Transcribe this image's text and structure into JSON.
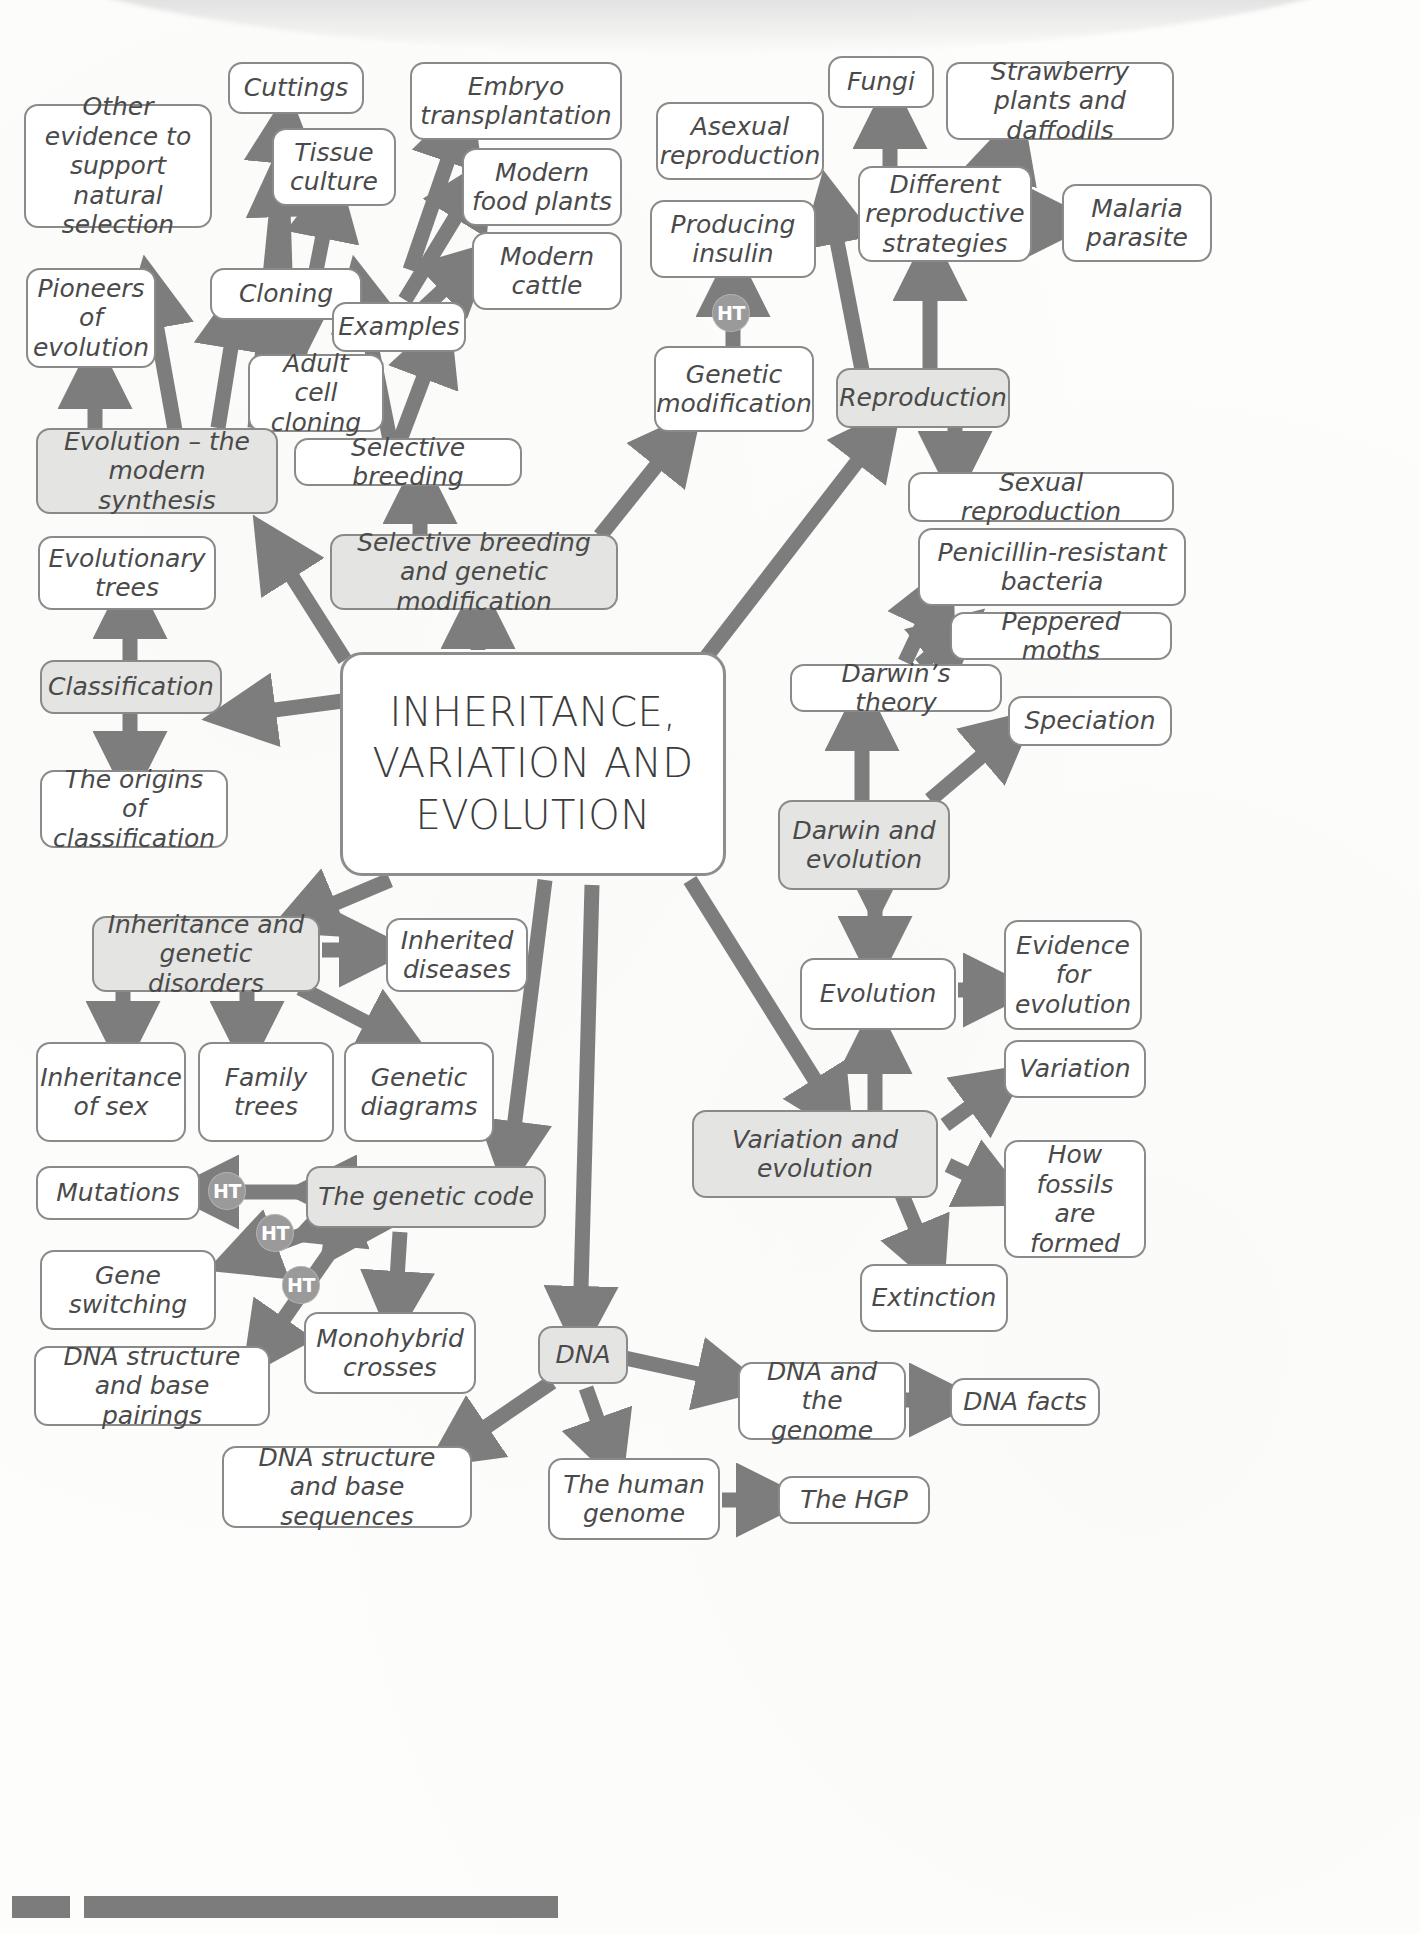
{
  "diagram": {
    "title": "INHERITANCE, VARIATION AND EVOLUTION",
    "type": "mind-map",
    "colors": {
      "box_border": "#8a8a8a",
      "box_fill": "#ffffff",
      "shaded_fill": "#e4e4e2",
      "arrow": "#7d7d7d",
      "text": "#4a4a4a",
      "ht_badge": "#9a9a9a",
      "footer_bar": "#7c7c7c"
    },
    "center": {
      "id": "center",
      "label": "INHERITANCE, VARIATION AND EVOLUTION"
    },
    "badges": [
      {
        "id": "ht1",
        "label": "HT"
      },
      {
        "id": "ht2",
        "label": "HT"
      },
      {
        "id": "ht3",
        "label": "HT"
      },
      {
        "id": "ht4",
        "label": "HT"
      }
    ],
    "nodes": [
      {
        "id": "other-evidence",
        "label": "Other evidence to support natural selection",
        "shaded": false
      },
      {
        "id": "cuttings",
        "label": "Cuttings",
        "shaded": false
      },
      {
        "id": "tissue-culture",
        "label": "Tissue culture",
        "shaded": false
      },
      {
        "id": "embryo-transplantation",
        "label": "Embryo transplantation",
        "shaded": false
      },
      {
        "id": "modern-food-plants",
        "label": "Modern food plants",
        "shaded": false
      },
      {
        "id": "modern-cattle",
        "label": "Modern cattle",
        "shaded": false
      },
      {
        "id": "asexual-reproduction",
        "label": "Asexual reproduction",
        "shaded": false
      },
      {
        "id": "fungi",
        "label": "Fungi",
        "shaded": false
      },
      {
        "id": "strawberry-daffodils",
        "label": "Strawberry plants and daffodils",
        "shaded": false
      },
      {
        "id": "producing-insulin",
        "label": "Producing insulin",
        "shaded": false
      },
      {
        "id": "different-repro",
        "label": "Different reproductive strategies",
        "shaded": false
      },
      {
        "id": "malaria-parasite",
        "label": "Malaria parasite",
        "shaded": false
      },
      {
        "id": "pioneers",
        "label": "Pioneers of evolution",
        "shaded": false
      },
      {
        "id": "cloning",
        "label": "Cloning",
        "shaded": false
      },
      {
        "id": "examples",
        "label": "Examples",
        "shaded": false
      },
      {
        "id": "genetic-modification",
        "label": "Genetic modification",
        "shaded": false
      },
      {
        "id": "reproduction",
        "label": "Reproduction",
        "shaded": true
      },
      {
        "id": "adult-cell-cloning",
        "label": "Adult cell cloning",
        "shaded": false
      },
      {
        "id": "evolution-modern",
        "label": "Evolution – the modern synthesis",
        "shaded": true
      },
      {
        "id": "selective-breeding",
        "label": "Selective breeding",
        "shaded": false
      },
      {
        "id": "sexual-reproduction",
        "label": "Sexual reproduction",
        "shaded": false
      },
      {
        "id": "evolutionary-trees",
        "label": "Evolutionary trees",
        "shaded": false
      },
      {
        "id": "sb-and-gm",
        "label": "Selective breeding and genetic modification",
        "shaded": true
      },
      {
        "id": "penicillin-bacteria",
        "label": "Penicillin-resistant bacteria",
        "shaded": false
      },
      {
        "id": "peppered-moths",
        "label": "Peppered moths",
        "shaded": false
      },
      {
        "id": "classification",
        "label": "Classification",
        "shaded": true
      },
      {
        "id": "darwins-theory",
        "label": "Darwin’s theory",
        "shaded": false
      },
      {
        "id": "speciation",
        "label": "Speciation",
        "shaded": false
      },
      {
        "id": "origins-classification",
        "label": "The origins of classification",
        "shaded": false
      },
      {
        "id": "darwin-evolution",
        "label": "Darwin and evolution",
        "shaded": true
      },
      {
        "id": "inheritance-disorders",
        "label": "Inheritance and genetic disorders",
        "shaded": true
      },
      {
        "id": "inherited-diseases",
        "label": "Inherited diseases",
        "shaded": false
      },
      {
        "id": "evidence-evolution",
        "label": "Evidence for evolution",
        "shaded": false
      },
      {
        "id": "evolution",
        "label": "Evolution",
        "shaded": false
      },
      {
        "id": "inheritance-of-sex",
        "label": "Inheritance of sex",
        "shaded": false
      },
      {
        "id": "family-trees",
        "label": "Family trees",
        "shaded": false
      },
      {
        "id": "genetic-diagrams",
        "label": "Genetic diagrams",
        "shaded": false
      },
      {
        "id": "variation",
        "label": "Variation",
        "shaded": false
      },
      {
        "id": "variation-evolution",
        "label": "Variation and evolution",
        "shaded": true
      },
      {
        "id": "how-fossils-formed",
        "label": "How fossils are formed",
        "shaded": false
      },
      {
        "id": "mutations",
        "label": "Mutations",
        "shaded": false
      },
      {
        "id": "genetic-code",
        "label": "The genetic code",
        "shaded": true
      },
      {
        "id": "gene-switching",
        "label": "Gene switching",
        "shaded": false
      },
      {
        "id": "extinction",
        "label": "Extinction",
        "shaded": false
      },
      {
        "id": "dna-structure-pairings",
        "label": "DNA structure and base pairings",
        "shaded": false
      },
      {
        "id": "monohybrid-crosses",
        "label": "Monohybrid crosses",
        "shaded": false
      },
      {
        "id": "dna",
        "label": "DNA",
        "shaded": true
      },
      {
        "id": "dna-and-genome",
        "label": "DNA and the genome",
        "shaded": false
      },
      {
        "id": "dna-facts",
        "label": "DNA facts",
        "shaded": false
      },
      {
        "id": "dna-structure-sequences",
        "label": "DNA structure and base sequences",
        "shaded": false
      },
      {
        "id": "human-genome",
        "label": "The human genome",
        "shaded": false
      },
      {
        "id": "the-hgp",
        "label": "The HGP",
        "shaded": false
      }
    ]
  }
}
